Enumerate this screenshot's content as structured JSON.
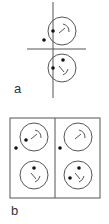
{
  "panels": [
    {
      "label": "a",
      "label_pos": [
        14,
        82
      ],
      "axes": {
        "vertical": {
          "x": 53,
          "y1": 2,
          "y2": 98
        },
        "horizontal": {
          "y": 49,
          "x1": 27,
          "x2": 86
        }
      },
      "faces": [
        {
          "cx": 62,
          "cy": 31,
          "r": 14,
          "mark": "upper"
        },
        {
          "cx": 62,
          "cy": 68,
          "r": 14,
          "mark": "lower"
        }
      ],
      "dots": [
        [
          44,
          40
        ],
        [
          53,
          31
        ],
        [
          53,
          68
        ],
        [
          63,
          60
        ]
      ]
    },
    {
      "label": "b",
      "label_pos": [
        11,
        204
      ],
      "frame": {
        "x": 10,
        "y": 118,
        "w": 90,
        "h": 80,
        "divider_x": 55
      },
      "faces": [
        {
          "cx": 34,
          "cy": 137,
          "r": 14,
          "mark": "upper"
        },
        {
          "cx": 34,
          "cy": 175,
          "r": 14,
          "mark": "lower"
        },
        {
          "cx": 78,
          "cy": 137,
          "r": 14,
          "mark": "upper"
        },
        {
          "cx": 78,
          "cy": 175,
          "r": 14,
          "mark": "lower"
        }
      ],
      "dots": [
        [
          16,
          148
        ],
        [
          26,
          140
        ],
        [
          34,
          168
        ],
        [
          60,
          148
        ],
        [
          79,
          168
        ],
        [
          70,
          178
        ]
      ]
    }
  ],
  "colors": {
    "line": "#555555",
    "dot": "#111111",
    "label": "#333333"
  }
}
